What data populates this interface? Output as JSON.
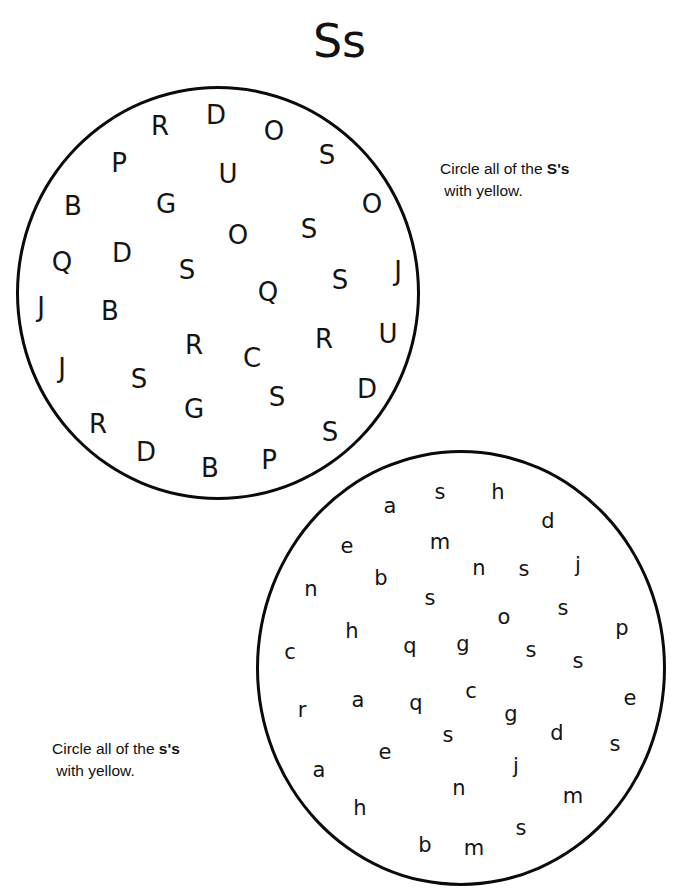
{
  "page": {
    "title": "Ss",
    "width": 679,
    "height": 890,
    "background_color": "#ffffff",
    "ink_color": "#111111"
  },
  "instructions": {
    "uppercase": {
      "lead": "Circle all of the ",
      "target": "S's",
      "tail": " with yellow."
    },
    "lowercase": {
      "lead": "Circle all of the ",
      "target": "s's",
      "tail": " with yellow."
    }
  },
  "upper_circle": {
    "name": "uppercase-letter-circle",
    "target_letter": "S",
    "letters": [
      {
        "char": "R",
        "x": 160,
        "y": 126
      },
      {
        "char": "D",
        "x": 216,
        "y": 115
      },
      {
        "char": "O",
        "x": 274,
        "y": 131
      },
      {
        "char": "P",
        "x": 119,
        "y": 163
      },
      {
        "char": "S",
        "x": 327,
        "y": 155
      },
      {
        "char": "U",
        "x": 228,
        "y": 174
      },
      {
        "char": "B",
        "x": 73,
        "y": 206
      },
      {
        "char": "G",
        "x": 166,
        "y": 204
      },
      {
        "char": "O",
        "x": 372,
        "y": 204
      },
      {
        "char": "O",
        "x": 238,
        "y": 235
      },
      {
        "char": "S",
        "x": 309,
        "y": 229
      },
      {
        "char": "Q",
        "x": 62,
        "y": 262
      },
      {
        "char": "D",
        "x": 122,
        "y": 253
      },
      {
        "char": "S",
        "x": 187,
        "y": 270
      },
      {
        "char": "S",
        "x": 340,
        "y": 280
      },
      {
        "char": "J",
        "x": 398,
        "y": 271
      },
      {
        "char": "Q",
        "x": 268,
        "y": 292
      },
      {
        "char": "J",
        "x": 41,
        "y": 307
      },
      {
        "char": "B",
        "x": 110,
        "y": 311
      },
      {
        "char": "R",
        "x": 194,
        "y": 345
      },
      {
        "char": "C",
        "x": 252,
        "y": 358
      },
      {
        "char": "R",
        "x": 324,
        "y": 339
      },
      {
        "char": "U",
        "x": 388,
        "y": 334
      },
      {
        "char": "J",
        "x": 62,
        "y": 368
      },
      {
        "char": "S",
        "x": 139,
        "y": 379
      },
      {
        "char": "S",
        "x": 277,
        "y": 397
      },
      {
        "char": "D",
        "x": 367,
        "y": 389
      },
      {
        "char": "G",
        "x": 194,
        "y": 409
      },
      {
        "char": "R",
        "x": 98,
        "y": 424
      },
      {
        "char": "S",
        "x": 330,
        "y": 432
      },
      {
        "char": "D",
        "x": 146,
        "y": 452
      },
      {
        "char": "B",
        "x": 210,
        "y": 468
      },
      {
        "char": "P",
        "x": 269,
        "y": 460
      }
    ]
  },
  "lower_circle": {
    "name": "lowercase-letter-circle",
    "target_letter": "s",
    "letters": [
      {
        "char": "s",
        "x": 440,
        "y": 492
      },
      {
        "char": "h",
        "x": 498,
        "y": 492
      },
      {
        "char": "a",
        "x": 390,
        "y": 506
      },
      {
        "char": "d",
        "x": 548,
        "y": 521
      },
      {
        "char": "e",
        "x": 347,
        "y": 546
      },
      {
        "char": "m",
        "x": 440,
        "y": 542
      },
      {
        "char": "n",
        "x": 479,
        "y": 568
      },
      {
        "char": "s",
        "x": 524,
        "y": 569
      },
      {
        "char": "j",
        "x": 578,
        "y": 565
      },
      {
        "char": "n",
        "x": 311,
        "y": 589
      },
      {
        "char": "b",
        "x": 381,
        "y": 578
      },
      {
        "char": "s",
        "x": 430,
        "y": 598
      },
      {
        "char": "o",
        "x": 504,
        "y": 617
      },
      {
        "char": "s",
        "x": 563,
        "y": 608
      },
      {
        "char": "h",
        "x": 352,
        "y": 631
      },
      {
        "char": "p",
        "x": 622,
        "y": 628
      },
      {
        "char": "c",
        "x": 290,
        "y": 652
      },
      {
        "char": "q",
        "x": 410,
        "y": 646
      },
      {
        "char": "g",
        "x": 463,
        "y": 644
      },
      {
        "char": "s",
        "x": 531,
        "y": 650
      },
      {
        "char": "s",
        "x": 578,
        "y": 661
      },
      {
        "char": "c",
        "x": 471,
        "y": 691
      },
      {
        "char": "a",
        "x": 358,
        "y": 700
      },
      {
        "char": "e",
        "x": 630,
        "y": 698
      },
      {
        "char": "r",
        "x": 302,
        "y": 710
      },
      {
        "char": "q",
        "x": 416,
        "y": 703
      },
      {
        "char": "g",
        "x": 511,
        "y": 714
      },
      {
        "char": "d",
        "x": 557,
        "y": 733
      },
      {
        "char": "s",
        "x": 448,
        "y": 735
      },
      {
        "char": "s",
        "x": 615,
        "y": 744
      },
      {
        "char": "e",
        "x": 385,
        "y": 752
      },
      {
        "char": "j",
        "x": 516,
        "y": 766
      },
      {
        "char": "a",
        "x": 319,
        "y": 770
      },
      {
        "char": "n",
        "x": 459,
        "y": 788
      },
      {
        "char": "m",
        "x": 573,
        "y": 796
      },
      {
        "char": "h",
        "x": 360,
        "y": 808
      },
      {
        "char": "s",
        "x": 521,
        "y": 828
      },
      {
        "char": "b",
        "x": 425,
        "y": 845
      },
      {
        "char": "m",
        "x": 474,
        "y": 848
      }
    ]
  }
}
